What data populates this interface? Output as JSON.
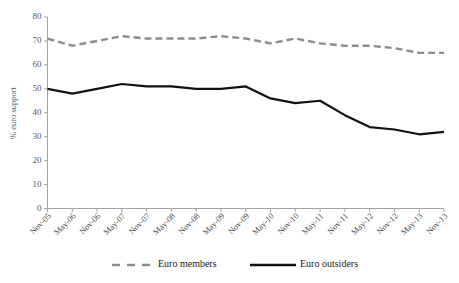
{
  "chart_data": {
    "type": "line",
    "title": "",
    "xlabel": "",
    "ylabel": "% euro support",
    "ylim": [
      0,
      80
    ],
    "ytick_step": 10,
    "grid": false,
    "legend_position": "bottom",
    "categories": [
      "Nov-05",
      "May-06",
      "Nov-06",
      "May-07",
      "Nov-07",
      "May-08",
      "Nov-08",
      "May-09",
      "Nov-09",
      "May-10",
      "Nov-10",
      "May-11",
      "Nov-11",
      "May-12",
      "Nov-12",
      "May-13",
      "Nov-13"
    ],
    "yticks": [
      0,
      10,
      20,
      30,
      40,
      50,
      60,
      70,
      80
    ],
    "series": [
      {
        "name": "Euro members",
        "style": "dashed",
        "color": "#8c8c8c",
        "values": [
          71,
          68,
          70,
          72,
          71,
          71,
          71,
          72,
          71,
          69,
          71,
          69,
          68,
          68,
          67,
          65,
          65
        ]
      },
      {
        "name": "Euro outsiders",
        "style": "solid",
        "color": "#111111",
        "values": [
          50,
          48,
          50,
          52,
          51,
          51,
          50,
          50,
          51,
          46,
          44,
          45,
          39,
          34,
          33,
          31,
          32
        ]
      }
    ]
  },
  "axes": {
    "ylabel": "% euro support"
  },
  "legend": {
    "items": [
      {
        "label": "Euro members"
      },
      {
        "label": "Euro outsiders"
      }
    ]
  }
}
